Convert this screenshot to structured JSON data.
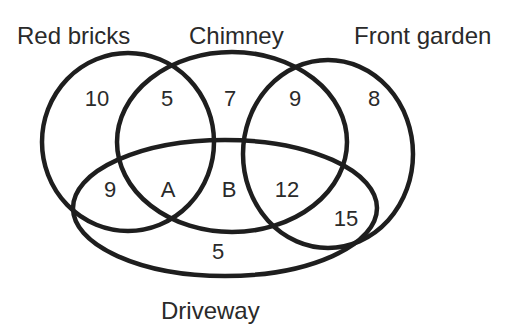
{
  "diagram": {
    "type": "venn",
    "sets": [
      {
        "name": "Red bricks"
      },
      {
        "name": "Chimney"
      },
      {
        "name": "Front garden"
      },
      {
        "name": "Driveway"
      }
    ],
    "regions": {
      "red_only": "10",
      "red_chimney": "5",
      "chimney_only": "7",
      "chimney_front": "9",
      "front_only": "8",
      "red_driveway": "9",
      "red_chimney_driveway": "A",
      "chimney_driveway": "B",
      "chimney_front_driveway": "12",
      "front_driveway": "15",
      "driveway_only": "5"
    }
  }
}
